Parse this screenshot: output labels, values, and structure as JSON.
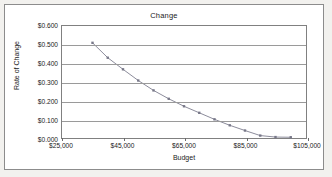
{
  "chart_data": {
    "type": "line",
    "title": "Change",
    "xlabel": "Budget",
    "ylabel": "Rate of Change",
    "xlim": [
      25000,
      105000
    ],
    "ylim": [
      0.0,
      0.6
    ],
    "grid": true,
    "legend": false,
    "xticks": [
      25000,
      45000,
      65000,
      85000,
      105000
    ],
    "xticklabels": [
      "$25,000",
      "$45,000",
      "$65,000",
      "$85,000",
      "$105,000"
    ],
    "yticks": [
      0.0,
      0.1,
      0.2,
      0.3,
      0.4,
      0.5,
      0.6
    ],
    "yticklabels": [
      "$0.000",
      "$0.100",
      "$0.200",
      "$0.300",
      "$0.400",
      "$0.500",
      "$0.600"
    ],
    "marker": "square",
    "series_color": "#8a8a99",
    "x": [
      35000,
      40000,
      45000,
      50000,
      55000,
      60000,
      65000,
      70000,
      75000,
      80000,
      85000,
      90000,
      95000,
      100000
    ],
    "values": [
      0.51,
      0.43,
      0.368,
      0.308,
      0.255,
      0.21,
      0.17,
      0.135,
      0.1,
      0.068,
      0.04,
      0.013,
      0.005,
      0.004
    ],
    "series": [
      {
        "name": "Rate of Change",
        "points": [
          {
            "x": 35000,
            "y": 0.51
          },
          {
            "x": 40000,
            "y": 0.43
          },
          {
            "x": 45000,
            "y": 0.368
          },
          {
            "x": 50000,
            "y": 0.308
          },
          {
            "x": 55000,
            "y": 0.255
          },
          {
            "x": 60000,
            "y": 0.21
          },
          {
            "x": 65000,
            "y": 0.17
          },
          {
            "x": 70000,
            "y": 0.135
          },
          {
            "x": 75000,
            "y": 0.1
          },
          {
            "x": 80000,
            "y": 0.068
          },
          {
            "x": 85000,
            "y": 0.04
          },
          {
            "x": 90000,
            "y": 0.013
          },
          {
            "x": 95000,
            "y": 0.005
          },
          {
            "x": 100000,
            "y": 0.004
          }
        ]
      }
    ]
  }
}
